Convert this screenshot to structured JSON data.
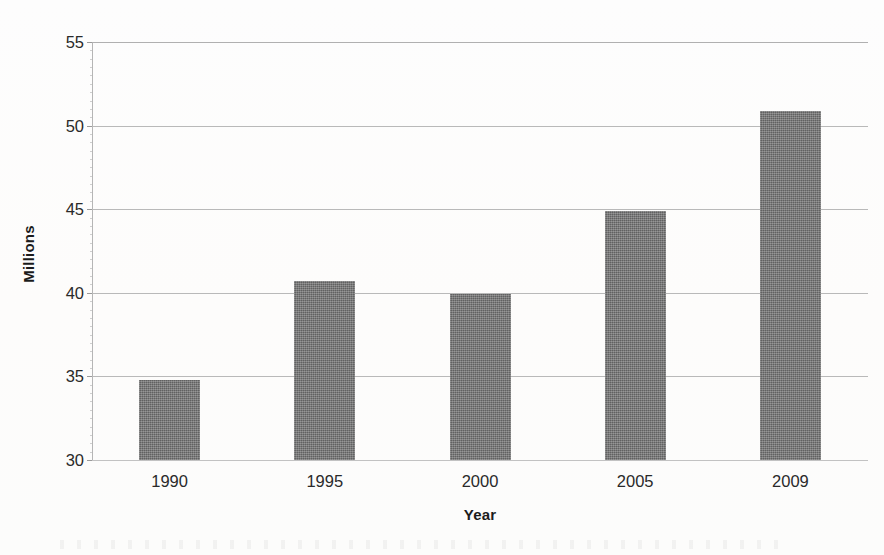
{
  "chart_data": {
    "type": "bar",
    "title": "",
    "xlabel": "Year",
    "ylabel": "Millions",
    "categories": [
      "1990",
      "1995",
      "2000",
      "2005",
      "2009"
    ],
    "values": [
      34.8,
      40.7,
      39.9,
      44.9,
      50.9
    ],
    "ylim": [
      30,
      55
    ],
    "yticks": [
      30,
      35,
      40,
      45,
      50,
      55
    ],
    "ytick_labels": [
      "30",
      "35",
      "40",
      "45",
      "50",
      "55"
    ],
    "grid": true,
    "grid_axis": "y",
    "legend": false,
    "legend_position": "none",
    "bar_color": "#6c6c6c",
    "gridline_color": "#b9b9b9",
    "axis_color": "#b5b5b5",
    "text_color": "#2a2a2a",
    "background_color": "#fefefe",
    "series": [
      {
        "name": "Millions",
        "values": [
          34.8,
          40.7,
          39.9,
          44.9,
          50.9
        ]
      }
    ]
  }
}
